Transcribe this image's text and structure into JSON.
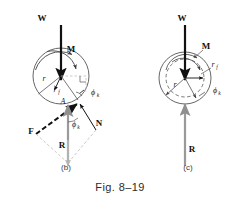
{
  "figure": {
    "caption": "Fig. 8–19",
    "panels": [
      {
        "id": "b",
        "label": "(b)"
      },
      {
        "id": "c",
        "label": "(c)"
      }
    ]
  },
  "panel_b": {
    "labels": {
      "weight": "W",
      "moment": "M",
      "radius": "r",
      "friction_radius": "r",
      "friction_radius_sub": "f",
      "contact_point": "A",
      "friction_angle": "ϕ",
      "friction_angle_sub": "k",
      "friction_force": "F",
      "normal_force": "N",
      "resultant": "R",
      "angle_at_resultant": "ϕ",
      "angle_at_resultant_sub": "k"
    }
  },
  "panel_c": {
    "labels": {
      "weight": "W",
      "moment": "M",
      "radius": "r",
      "friction_radius": "r",
      "friction_radius_sub": "f",
      "friction_angle": "ϕ",
      "friction_angle_sub": "k",
      "resultant": "R"
    }
  },
  "colors": {
    "ink": "#111111",
    "gray_vector": "#8f8f8f",
    "light_construction": "#bdbdbd",
    "mid_line": "#555555",
    "background": "#ffffff"
  }
}
